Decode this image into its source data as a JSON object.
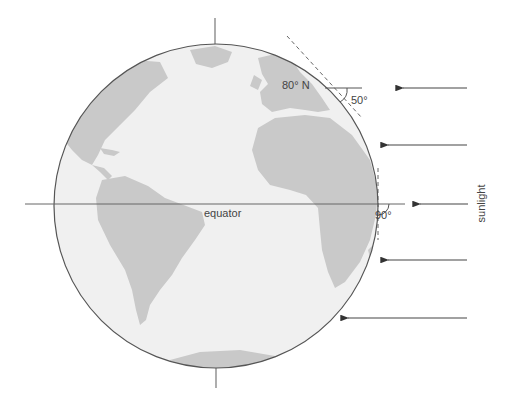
{
  "diagram": {
    "labels": {
      "latitude": "80° N",
      "angle_high": "50°",
      "angle_equator": "90°",
      "equator": "equator",
      "sunlight": "sunlight"
    },
    "arrows_count": 5,
    "colors": {
      "ocean": "#f0f0f0",
      "land": "#c8c8c8",
      "outline": "#555555",
      "line": "#555555",
      "text": "#444444"
    }
  }
}
